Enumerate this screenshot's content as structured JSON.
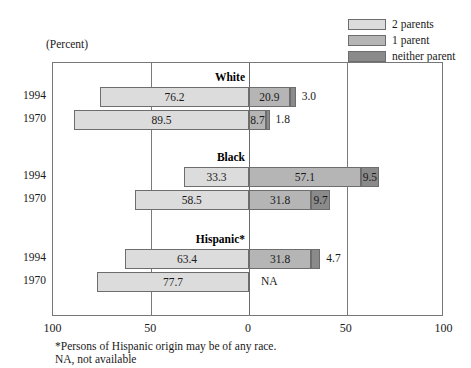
{
  "caption": "(Percent)",
  "legend": {
    "items": [
      {
        "label": "2 parents",
        "color": "#dcdcdc",
        "key": "two_parents"
      },
      {
        "label": "1 parent",
        "color": "#b5b5b5",
        "key": "one_parent"
      },
      {
        "label": "neither parent",
        "color": "#8a8a8a",
        "key": "neither_parent"
      }
    ]
  },
  "axis": {
    "ticks": [
      {
        "label": "100",
        "value": -100
      },
      {
        "label": "50",
        "value": -50
      },
      {
        "label": "0",
        "value": 0
      },
      {
        "label": "50",
        "value": 50
      },
      {
        "label": "100",
        "value": 100
      }
    ],
    "min": -100,
    "max": 100
  },
  "footnotes": [
    "*Persons of Hispanic origin may be of any race.",
    "NA, not available"
  ],
  "chart_data": {
    "type": "bar",
    "orientation": "horizontal",
    "subtype": "diverging-stacked",
    "title": "",
    "subtitle": "(Percent)",
    "xlabel": "",
    "ylabel": "",
    "xlim": [
      -100,
      100
    ],
    "grid": true,
    "legend_position": "top-right",
    "axis_tick_labels": [
      "100",
      "50",
      "0",
      "50",
      "100"
    ],
    "series": [
      {
        "name": "2 parents",
        "color": "#dcdcdc",
        "direction": "left"
      },
      {
        "name": "1 parent",
        "color": "#b5b5b5",
        "direction": "right"
      },
      {
        "name": "neither parent",
        "color": "#8a8a8a",
        "direction": "right"
      }
    ],
    "groups": [
      {
        "name": "White",
        "rows": [
          {
            "year": "1994",
            "two_parents": 76.2,
            "one_parent": 20.9,
            "neither_parent": 3.0,
            "two_parents_label": "76.2",
            "one_parent_label": "20.9",
            "neither_parent_label": "3.0",
            "neither_label_outside": true
          },
          {
            "year": "1970",
            "two_parents": 89.5,
            "one_parent": 8.7,
            "neither_parent": 1.8,
            "two_parents_label": "89.5",
            "one_parent_label": "8.7",
            "neither_parent_label": "1.8",
            "neither_label_outside": true
          }
        ]
      },
      {
        "name": "Black",
        "rows": [
          {
            "year": "1994",
            "two_parents": 33.3,
            "one_parent": 57.1,
            "neither_parent": 9.5,
            "two_parents_label": "33.3",
            "one_parent_label": "57.1",
            "neither_parent_label": "9.5",
            "neither_label_outside": false
          },
          {
            "year": "1970",
            "two_parents": 58.5,
            "one_parent": 31.8,
            "neither_parent": 9.7,
            "two_parents_label": "58.5",
            "one_parent_label": "31.8",
            "neither_parent_label": "9.7",
            "neither_label_outside": false
          }
        ]
      },
      {
        "name": "Hispanic*",
        "rows": [
          {
            "year": "1994",
            "two_parents": 63.4,
            "one_parent": 31.8,
            "neither_parent": 4.7,
            "two_parents_label": "63.4",
            "one_parent_label": "31.8",
            "neither_parent_label": "4.7",
            "neither_label_outside": true
          },
          {
            "year": "1970",
            "two_parents": 77.7,
            "one_parent": null,
            "neither_parent": null,
            "two_parents_label": "77.7",
            "one_parent_label": "NA",
            "neither_parent_label": "",
            "na": true
          }
        ]
      }
    ]
  }
}
